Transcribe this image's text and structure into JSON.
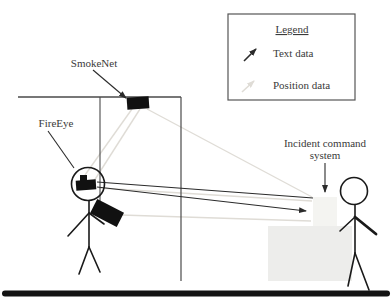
{
  "figure": {
    "type": "system-architecture-diagram",
    "labels": {
      "smokenet": "SmokeNet",
      "fireeye": "FireEye",
      "ics_line1": "Incident command",
      "ics_line2": "system"
    },
    "legend": {
      "title": "Legend",
      "items": [
        {
          "icon": "dark-arrow-icon",
          "label": "Text data"
        },
        {
          "icon": "light-arrow-icon",
          "label": "Position data"
        }
      ]
    },
    "colors": {
      "text_data": "#2b2b2b",
      "position_data": "#dfdcd6",
      "structure": "#4a4a4a",
      "figure_stroke": "#1a1a1a",
      "device_fill": "#111111",
      "ics_box_fill": "#f4f4f1",
      "ics_box_border": "#8f8f8d",
      "desk_fill": "#ededeb",
      "desk_border": "#b3b3b1",
      "bottom_bar": "#131313",
      "legend_border": "#555555"
    }
  }
}
